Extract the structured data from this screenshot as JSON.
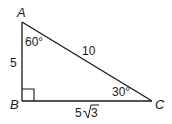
{
  "figure": {
    "type": "right-triangle",
    "vertices": {
      "A": {
        "label": "A",
        "x": 22,
        "y": 22
      },
      "B": {
        "label": "B",
        "x": 22,
        "y": 101
      },
      "C": {
        "label": "C",
        "x": 152,
        "y": 101
      }
    },
    "sides": {
      "AB": "5",
      "AC": "10",
      "BC_coef": "5",
      "BC_radicand": "3"
    },
    "angles": {
      "A": "60°",
      "C": "30°",
      "B": "right-angle"
    },
    "colors": {
      "stroke": "#1a1a1a",
      "background": "#ffffff"
    }
  }
}
